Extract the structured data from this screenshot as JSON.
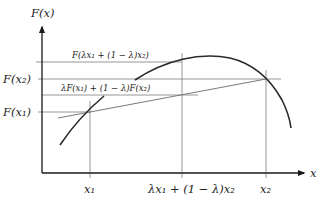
{
  "diagram": {
    "colors": {
      "axis": "#1a1a1a",
      "curve": "#2a2a2a",
      "guide": "#8a8a8a",
      "chord": "#7a7a7a",
      "text": "#222222"
    },
    "axes": {
      "y_label": "F(x)",
      "x_label": "x"
    },
    "y_labels": {
      "f_x2": "F(x₂)",
      "f_x1": "F(x₁)"
    },
    "x_labels": {
      "x1": "x₁",
      "mid": "λx₁ + (1 − λ)x₂",
      "x2": "x₂"
    },
    "annotations": {
      "f_of_mix": "F(λx₁ + (1 − λ)x₂)",
      "mix_of_f": "λF(x₁) + (1 − λ)F(x₂)"
    }
  }
}
